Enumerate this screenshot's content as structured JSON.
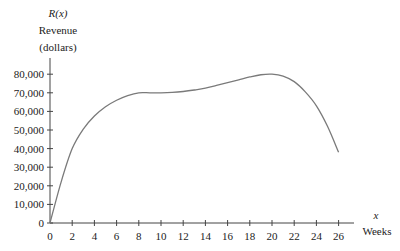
{
  "chart_data": {
    "type": "line",
    "title": "",
    "ylabel_var": "R(x)",
    "ylabel_line1": "Revenue",
    "ylabel_line2": "(dollars)",
    "xlabel_var": "x",
    "xlabel": "Weeks",
    "xlim": [
      0,
      27.5
    ],
    "ylim": [
      0,
      88000
    ],
    "grid": false,
    "legend": null,
    "x_ticks": [
      0,
      2,
      4,
      6,
      8,
      10,
      12,
      14,
      16,
      18,
      20,
      22,
      24,
      26
    ],
    "x_tick_labels": [
      "0",
      "2",
      "4",
      "6",
      "8",
      "10",
      "12",
      "14",
      "16",
      "18",
      "20",
      "22",
      "24",
      "26"
    ],
    "y_ticks": [
      0,
      10000,
      20000,
      30000,
      40000,
      50000,
      60000,
      70000,
      80000
    ],
    "y_tick_labels": [
      "0",
      "10,000",
      "20,000",
      "30,000",
      "40,000",
      "50,000",
      "60,000",
      "70,000",
      "80,000"
    ],
    "series": [
      {
        "name": "R(x)",
        "color": "#7a7a7a",
        "x": [
          0,
          1,
          2,
          3,
          4,
          5,
          6,
          7,
          8,
          9,
          10,
          11,
          12,
          13,
          14,
          15,
          16,
          17,
          18,
          19,
          20,
          21,
          22,
          23,
          24,
          25,
          26
        ],
        "y": [
          0,
          22000,
          40000,
          50500,
          57500,
          62500,
          66000,
          68500,
          70000,
          70000,
          70000,
          70200,
          70700,
          71500,
          72500,
          74000,
          75500,
          77000,
          78500,
          79700,
          80000,
          79000,
          76000,
          70500,
          63000,
          52000,
          38000
        ]
      }
    ]
  }
}
